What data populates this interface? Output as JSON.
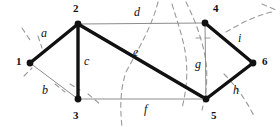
{
  "diagram": {
    "colors": {
      "background": "#ffffff",
      "tree_edge": "#111111",
      "link_edge": "#8d8d8d",
      "cut_curve": "#9a9a9a",
      "node_fill": "#111111",
      "label": "#111111"
    },
    "nodes": [
      {
        "id": "n1",
        "label": "1",
        "x": 30,
        "y": 63,
        "lx": 16,
        "ly": 56
      },
      {
        "id": "n2",
        "label": "2",
        "x": 78,
        "y": 24,
        "lx": 73,
        "ly": 3
      },
      {
        "id": "n3",
        "label": "3",
        "x": 78,
        "y": 99,
        "lx": 73,
        "ly": 110
      },
      {
        "id": "n4",
        "label": "4",
        "x": 205,
        "y": 23,
        "lx": 213,
        "ly": 3
      },
      {
        "id": "n5",
        "label": "5",
        "x": 206,
        "y": 99,
        "lx": 211,
        "ly": 110
      },
      {
        "id": "n6",
        "label": "6",
        "x": 253,
        "y": 63,
        "lx": 262,
        "ly": 56
      }
    ],
    "edges": [
      {
        "id": "a",
        "label": "a",
        "from": "n1",
        "to": "n2",
        "style": "thick",
        "lx": 41,
        "ly": 27
      },
      {
        "id": "b",
        "label": "b",
        "from": "n1",
        "to": "n3",
        "style": "thin",
        "lx": 42,
        "ly": 84
      },
      {
        "id": "c",
        "label": "c",
        "from": "n2",
        "to": "n3",
        "style": "thick",
        "lx": 84,
        "ly": 55
      },
      {
        "id": "d",
        "label": "d",
        "from": "n2",
        "to": "n4",
        "style": "thin",
        "lx": 134,
        "ly": 6
      },
      {
        "id": "e",
        "label": "e",
        "from": "n2",
        "to": "n5",
        "style": "thick",
        "lx": 133,
        "ly": 46
      },
      {
        "id": "f",
        "label": "f",
        "from": "n3",
        "to": "n5",
        "style": "thin",
        "lx": 144,
        "ly": 103
      },
      {
        "id": "g",
        "label": "g",
        "from": "n4",
        "to": "n5",
        "style": "thin",
        "lx": 195,
        "ly": 58
      },
      {
        "id": "h",
        "label": "h",
        "from": "n5",
        "to": "n6",
        "style": "thick",
        "lx": 233,
        "ly": 84
      },
      {
        "id": "i",
        "label": "i",
        "from": "n4",
        "to": "n6",
        "style": "thick",
        "lx": 238,
        "ly": 32
      }
    ],
    "cut_curves": [
      {
        "id": "cut-left-1",
        "d": "M 22 28 L 30 40"
      },
      {
        "id": "cut-left-2",
        "d": "M 38 36 L 42 48"
      },
      {
        "id": "cut-left-3",
        "d": "M 24 76 L 32 68"
      },
      {
        "id": "cut-left-4",
        "d": "M 55 84 L 65 92"
      },
      {
        "id": "cut-left-5",
        "d": "M 70 84 L 80 90"
      },
      {
        "id": "cut-left-6",
        "d": "M 88 94 L 100 104"
      },
      {
        "id": "cut-center",
        "d": "M 158 2 C 152 26 140 46 126 72 C 120 90 120 108 122 127"
      },
      {
        "id": "cut-mid-2",
        "d": "M 172 4 C 178 24 184 40 186 58 C 188 76 186 92 182 108"
      },
      {
        "id": "cut-right-1",
        "d": "M 186 2 C 196 22 203 42 206 62 C 208 80 206 94 202 110"
      },
      {
        "id": "cut-right-2",
        "d": "M 196 38 L 212 38"
      },
      {
        "id": "cut-right-3",
        "d": "M 226 32 C 240 24 254 16 272 12"
      },
      {
        "id": "cut-right-4",
        "d": "M 224 74 C 236 86 246 100 254 116"
      },
      {
        "id": "cut-right-5",
        "d": "M 262 4 L 276 10"
      }
    ]
  }
}
